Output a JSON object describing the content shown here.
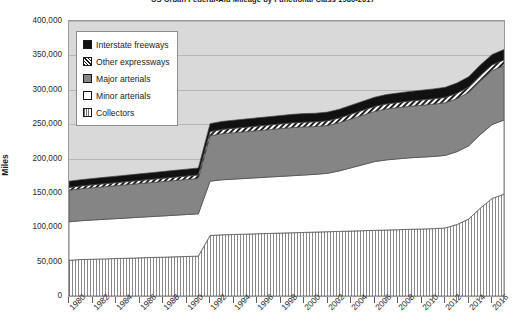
{
  "chart_data": {
    "type": "area",
    "stacked": true,
    "title": "US Urban Federal-Aid Mileage by Functional Class 1980-2017",
    "xlabel": "",
    "ylabel": "Miles",
    "ylim": [
      0,
      400000
    ],
    "ytick_step": 50000,
    "ytick_labels": [
      "400,000",
      "350,000",
      "300,000",
      "250,000",
      "200,000",
      "150,000",
      "100,000",
      "50,000",
      "0"
    ],
    "xlim": [
      1980,
      2017
    ],
    "grid": true,
    "legend_position": "top-left-inside",
    "x": [
      1980,
      1981,
      1982,
      1983,
      1984,
      1985,
      1986,
      1987,
      1988,
      1989,
      1990,
      1991,
      1992,
      1993,
      1994,
      1995,
      1996,
      1997,
      1998,
      1999,
      2000,
      2001,
      2002,
      2003,
      2004,
      2005,
      2006,
      2007,
      2008,
      2009,
      2010,
      2011,
      2012,
      2013,
      2014,
      2015,
      2016,
      2017
    ],
    "xtick_labels": [
      "1980",
      "1982",
      "1984",
      "1986",
      "1988",
      "1990",
      "1992",
      "1994",
      "1996",
      "1998",
      "2000",
      "2002",
      "2004",
      "2006",
      "2008",
      "2010",
      "2012",
      "2014",
      "2016"
    ],
    "series": [
      {
        "name": "Collectors",
        "color": "#ffffff",
        "pattern": "vertical-lines",
        "values": [
          52000,
          53000,
          53500,
          54000,
          54500,
          55000,
          55500,
          56000,
          56500,
          57000,
          57500,
          58000,
          88000,
          89000,
          89500,
          90000,
          90500,
          91000,
          91500,
          92000,
          92500,
          93000,
          93500,
          94000,
          94500,
          95000,
          95500,
          96000,
          96500,
          97000,
          97500,
          98000,
          99000,
          104000,
          112000,
          128000,
          142000,
          148000
        ]
      },
      {
        "name": "Minor arterials",
        "color": "#ffffff",
        "pattern": "solid",
        "values": [
          56000,
          56500,
          57000,
          57500,
          58000,
          58500,
          59000,
          59500,
          60000,
          60500,
          61000,
          61500,
          79000,
          80000,
          80500,
          81000,
          81500,
          82000,
          82500,
          83000,
          83500,
          84000,
          85000,
          88000,
          92000,
          96000,
          100000,
          102000,
          103000,
          104000,
          104500,
          105000,
          105500,
          106000,
          106500,
          107000,
          107500,
          108000
        ]
      },
      {
        "name": "Major arterials",
        "color": "#858585",
        "pattern": "solid",
        "values": [
          46000,
          46500,
          47000,
          47500,
          48000,
          48500,
          49000,
          49500,
          50000,
          50500,
          51000,
          51500,
          66000,
          67000,
          67500,
          68000,
          68500,
          69000,
          69500,
          70000,
          70000,
          69500,
          69500,
          70000,
          71000,
          72000,
          73000,
          74000,
          74500,
          75000,
          75500,
          76000,
          76500,
          77000,
          77500,
          78000,
          78500,
          79000
        ]
      },
      {
        "name": "Other expressways",
        "color": "#ffffff",
        "pattern": "diagonal-hatch",
        "values": [
          4000,
          4100,
          4200,
          4300,
          4400,
          4500,
          4600,
          4700,
          4800,
          4900,
          5000,
          5100,
          6200,
          6300,
          6400,
          6500,
          6600,
          6700,
          6800,
          6900,
          6900,
          6900,
          6900,
          7000,
          7100,
          7200,
          7300,
          7400,
          7500,
          7600,
          7700,
          7800,
          7900,
          8000,
          8100,
          8200,
          8300,
          8400
        ]
      },
      {
        "name": "Interstate freeways",
        "color": "#111111",
        "pattern": "solid",
        "values": [
          9000,
          9100,
          9200,
          9300,
          9400,
          9500,
          9600,
          9700,
          9800,
          9900,
          10000,
          10100,
          11500,
          11700,
          11800,
          11900,
          12000,
          12100,
          12200,
          12300,
          12400,
          12500,
          12600,
          12800,
          13000,
          13200,
          13400,
          13600,
          13800,
          14000,
          14200,
          14400,
          14600,
          14800,
          14900,
          15000,
          15100,
          15200
        ]
      }
    ]
  },
  "legend": {
    "items": [
      {
        "label": "Interstate freeways",
        "swatch": "sw-interstate"
      },
      {
        "label": "Other expressways",
        "swatch": "sw-otherexp"
      },
      {
        "label": "Major arterials",
        "swatch": "sw-major"
      },
      {
        "label": "Minor arterials",
        "swatch": "sw-minor"
      },
      {
        "label": "Collectors",
        "swatch": "sw-collectors"
      }
    ]
  }
}
